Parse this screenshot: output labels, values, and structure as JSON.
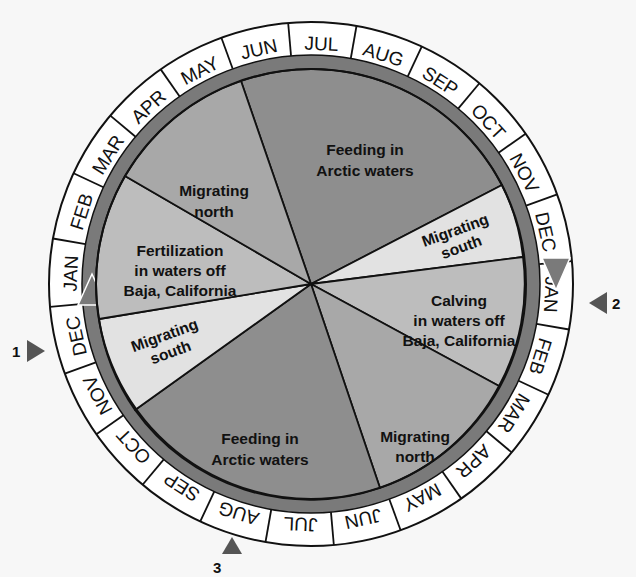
{
  "diagram": {
    "type": "circular annual cycle diagram",
    "colors": {
      "background": "#f7f7f7",
      "ring_fill": "#ffffff",
      "ring_arrow": "#7a7a7a",
      "feeding": "#8e8e8e",
      "migrating_north": "#a8a8a8",
      "baja": "#bdbdbd",
      "migrating_south": "#e2e2e2",
      "lines": "#111111"
    },
    "outer_ring_months_top_half": [
      "MAR",
      "APR",
      "MAY",
      "JUN",
      "JUL",
      "AUG",
      "SEP",
      "OCT",
      "NOV",
      "DEC"
    ],
    "outer_ring_months": [
      {
        "label": "JUN",
        "angle": -98
      },
      {
        "label": "JUL",
        "angle": -80
      },
      {
        "label": "AUG",
        "angle": -62
      },
      {
        "label": "SEP",
        "angle": -44
      },
      {
        "label": "OCT",
        "angle": -26
      },
      {
        "label": "NOV",
        "angle": -8
      },
      {
        "label": "DEC",
        "angle": 10
      },
      {
        "label": "JAN",
        "angle": 28
      },
      {
        "label": "FEB",
        "angle": 46
      },
      {
        "label": "MAR",
        "angle": 64
      },
      {
        "label": "APR",
        "angle": 82
      },
      {
        "label": "MAY",
        "angle": 100
      },
      {
        "label": "JUN",
        "angle": 118
      },
      {
        "label": "JUL",
        "angle": 136
      },
      {
        "label": "AUG",
        "angle": 154
      },
      {
        "label": "SEP",
        "angle": 172
      },
      {
        "label": "OCT",
        "angle": 190
      },
      {
        "label": "NOV",
        "angle": 208
      },
      {
        "label": "DEC",
        "angle": 226
      },
      {
        "label": "JAN",
        "angle": 244
      },
      {
        "label": "FEB",
        "angle": 262
      },
      {
        "label": "MAR",
        "angle": 280
      },
      {
        "label": "APR",
        "angle": 298
      },
      {
        "label": "MAY",
        "angle": 316
      }
    ],
    "segments": [
      {
        "id": "feeding-top",
        "lines": [
          "Feeding in",
          "Arctic waters"
        ],
        "shade": "feeding"
      },
      {
        "id": "migrating-south-right",
        "lines": [
          "Migrating",
          "south"
        ],
        "shade": "migrating_south"
      },
      {
        "id": "calving",
        "lines": [
          "Calving",
          "in waters off",
          "Baja, California"
        ],
        "shade": "baja"
      },
      {
        "id": "migrating-north-bottom-right",
        "lines": [
          "Migrating",
          "north"
        ],
        "shade": "migrating_north"
      },
      {
        "id": "feeding-bottom",
        "lines": [
          "Feeding in",
          "Arctic waters"
        ],
        "shade": "feeding"
      },
      {
        "id": "migrating-south-left",
        "lines": [
          "Migrating",
          "south"
        ],
        "shade": "migrating_south"
      },
      {
        "id": "fertilization",
        "lines": [
          "Fertilization",
          "in waters off",
          "Baja, California"
        ],
        "shade": "baja"
      },
      {
        "id": "migrating-north-top-left",
        "lines": [
          "Migrating",
          "north"
        ],
        "shade": "migrating_north"
      }
    ],
    "markers": [
      {
        "number": "1",
        "position": "left, between DEC and NOV"
      },
      {
        "number": "2",
        "position": "right, at JAN"
      },
      {
        "number": "3",
        "position": "bottom, at AUG"
      }
    ]
  },
  "labels": {
    "seg_feeding_top_1": "Feeding in",
    "seg_feeding_top_2": "Arctic waters",
    "seg_mn_tl_1": "Migrating",
    "seg_mn_tl_2": "north",
    "seg_fert_1": "Fertilization",
    "seg_fert_2": "in waters off",
    "seg_fert_3": "Baja, California",
    "seg_ms_left_1": "Migrating",
    "seg_ms_left_2": "south",
    "seg_feeding_bot_1": "Feeding in",
    "seg_feeding_bot_2": "Arctic waters",
    "seg_mn_br_1": "Migrating",
    "seg_mn_br_2": "north",
    "seg_calving_1": "Calving",
    "seg_calving_2": "in waters off",
    "seg_calving_3": "Baja, California",
    "seg_ms_right_1": "Migrating",
    "seg_ms_right_2": "south",
    "marker_1": "1",
    "marker_2": "2",
    "marker_3": "3",
    "m0": "JUN",
    "m1": "JUL",
    "m2": "AUG",
    "m3": "SEP",
    "m4": "OCT",
    "m5": "NOV",
    "m6": "DEC",
    "m7": "JAN",
    "m8": "FEB",
    "m9": "MAR",
    "m10": "APR",
    "m11": "MAY",
    "m12": "JUN",
    "m13": "JUL",
    "m14": "AUG",
    "m15": "SEP",
    "m16": "OCT",
    "m17": "NOV",
    "m18": "DEC",
    "m19": "JAN",
    "m20": "FEB",
    "m21": "MAR",
    "m22": "APR",
    "m23": "MAY"
  }
}
